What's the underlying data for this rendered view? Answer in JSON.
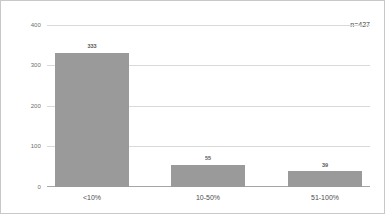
{
  "chart_data": {
    "type": "bar",
    "title": "",
    "subtitle": "",
    "xlabel": "",
    "ylabel": "",
    "categories": [
      "<10%",
      "10-50%",
      "51-100%"
    ],
    "values": [
      333,
      55,
      39
    ],
    "value_labels": [
      "333",
      "55",
      "39"
    ],
    "ylim": [
      0,
      400
    ],
    "y_ticks": [
      0,
      100,
      200,
      300,
      400
    ],
    "y_tick_labels": [
      "0",
      "100",
      "200",
      "300",
      "400"
    ],
    "grid": true,
    "grid_axis": "y",
    "legend": null,
    "legend_position": "none",
    "annotations": [
      {
        "text": "n=427",
        "position": "top-right"
      }
    ],
    "bar_color": "#9a9a9a",
    "grid_color": "#d9d9d9",
    "axis_color": "#a6a6a6",
    "border_color": "#c8c8c8",
    "background": "#ffffff"
  }
}
